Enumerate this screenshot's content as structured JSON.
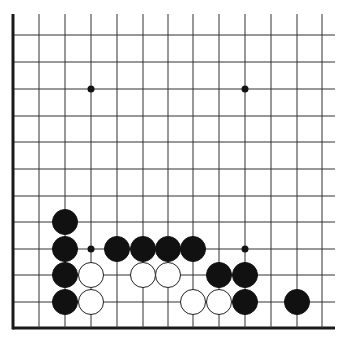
{
  "board": {
    "type": "go-board-corner",
    "background": "#ffffff",
    "line_color": "#333333",
    "edges": [
      "left",
      "bottom"
    ],
    "columns_x": [
      13,
      39,
      65,
      91,
      117,
      143,
      168,
      193,
      219,
      245,
      271,
      297,
      322
    ],
    "rows_y": [
      35,
      62,
      89,
      116,
      142,
      169,
      196,
      222,
      249,
      275,
      302,
      328
    ],
    "grid_top": 14,
    "grid_right": 335,
    "left_edge_x": 13,
    "bottom_edge_y": 328,
    "stone_radius": 12.5,
    "star_radius": 3.5,
    "star_points": [
      {
        "col": 3,
        "row": 2
      },
      {
        "col": 9,
        "row": 2
      },
      {
        "col": 3,
        "row": 8
      },
      {
        "col": 9,
        "row": 8
      }
    ],
    "stones": [
      {
        "color": "black",
        "col": 2,
        "row": 7
      },
      {
        "color": "black",
        "col": 2,
        "row": 8
      },
      {
        "color": "black",
        "col": 2,
        "row": 9
      },
      {
        "color": "black",
        "col": 2,
        "row": 10
      },
      {
        "color": "black",
        "col": 4,
        "row": 8
      },
      {
        "color": "black",
        "col": 5,
        "row": 8
      },
      {
        "color": "black",
        "col": 6,
        "row": 8
      },
      {
        "color": "black",
        "col": 7,
        "row": 8
      },
      {
        "color": "black",
        "col": 8,
        "row": 9
      },
      {
        "color": "black",
        "col": 9,
        "row": 9
      },
      {
        "color": "black",
        "col": 9,
        "row": 10
      },
      {
        "color": "black",
        "col": 11,
        "row": 10
      },
      {
        "color": "white",
        "col": 3,
        "row": 9
      },
      {
        "color": "white",
        "col": 3,
        "row": 10
      },
      {
        "color": "white",
        "col": 5,
        "row": 9
      },
      {
        "color": "white",
        "col": 6,
        "row": 9
      },
      {
        "color": "white",
        "col": 7,
        "row": 10
      },
      {
        "color": "white",
        "col": 8,
        "row": 10
      }
    ]
  }
}
